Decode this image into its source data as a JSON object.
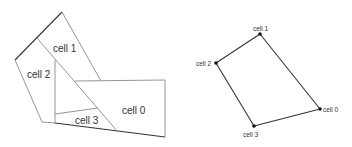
{
  "left_diagram": {
    "title": "cell partition",
    "cells": [
      {
        "label": "cell 0",
        "x": 131,
        "y": 111
      },
      {
        "label": "cell 1",
        "x": 69,
        "y": 50
      },
      {
        "label": "cell 2",
        "x": 36,
        "y": 78
      },
      {
        "label": "cell 3",
        "x": 83,
        "y": 124
      }
    ]
  },
  "right_diagram": {
    "title": "adjacency graph",
    "nodes": [
      {
        "label": "cell 0",
        "x": 320,
        "y": 109
      },
      {
        "label": "cell 1",
        "x": 260,
        "y": 34
      },
      {
        "label": "cell 2",
        "x": 216,
        "y": 63
      },
      {
        "label": "cell 3",
        "x": 254,
        "y": 126
      }
    ],
    "edges": [
      [
        "cell 1",
        "cell 2"
      ],
      [
        "cell 1",
        "cell 0"
      ],
      [
        "cell 2",
        "cell 3"
      ],
      [
        "cell 3",
        "cell 0"
      ]
    ]
  },
  "colors": {
    "thin_line": "#8a8a8a",
    "thick_line": "#333333",
    "node": "#111111",
    "text": "#333333"
  }
}
